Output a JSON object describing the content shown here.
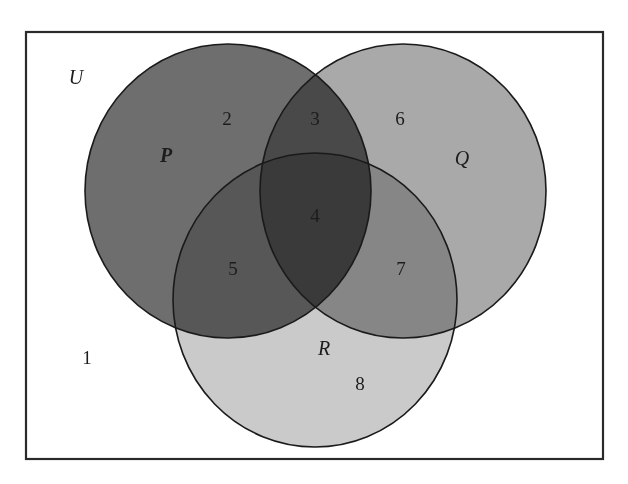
{
  "diagram": {
    "type": "venn",
    "universe": {
      "label": "U",
      "label_pos": [
        76,
        77
      ],
      "rect": {
        "x": 26,
        "y": 32,
        "width": 577,
        "height": 427
      },
      "stroke": "#2a2a2a",
      "fill": "#ffffff"
    },
    "sets": [
      {
        "name": "P",
        "label": "P",
        "cx": 228,
        "cy": 191,
        "rx": 143,
        "ry": 147,
        "fill": "#6e6e6e",
        "label_pos": [
          166,
          155
        ]
      },
      {
        "name": "Q",
        "label": "Q",
        "cx": 403,
        "cy": 191,
        "rx": 143,
        "ry": 147,
        "fill": "#a9a9a9",
        "label_pos": [
          462,
          158
        ]
      },
      {
        "name": "R",
        "label": "R",
        "cx": 315,
        "cy": 300,
        "rx": 142,
        "ry": 147,
        "fill": "#cacaca",
        "label_pos": [
          324,
          348
        ]
      }
    ],
    "regions": [
      {
        "number": "1",
        "description": "outside P, Q and R",
        "pos": [
          87,
          357
        ]
      },
      {
        "number": "2",
        "description": "P only",
        "pos": [
          227,
          118
        ]
      },
      {
        "number": "3",
        "description": "P and Q only",
        "pos": [
          315,
          118
        ]
      },
      {
        "number": "4",
        "description": "P, Q and R",
        "pos": [
          315,
          215
        ]
      },
      {
        "number": "5",
        "description": "P and R only",
        "pos": [
          233,
          268
        ]
      },
      {
        "number": "6",
        "description": "Q only",
        "pos": [
          400,
          118
        ]
      },
      {
        "number": "7",
        "description": "Q and R only",
        "pos": [
          401,
          268
        ]
      },
      {
        "number": "8",
        "description": "R only",
        "pos": [
          360,
          383
        ]
      }
    ]
  },
  "labels": {
    "universe": "U",
    "set_p": "P",
    "set_q": "Q",
    "set_r": "R",
    "region_1": "1",
    "region_2": "2",
    "region_3": "3",
    "region_4": "4",
    "region_5": "5",
    "region_6": "6",
    "region_7": "7",
    "region_8": "8"
  }
}
